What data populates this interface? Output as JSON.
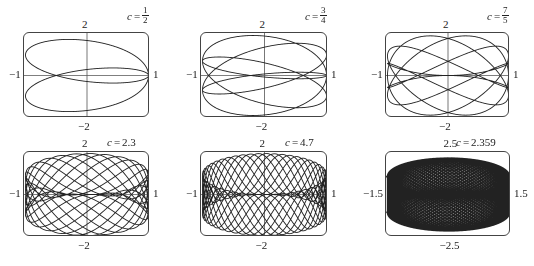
{
  "figure": {
    "line_color": "#222222",
    "axis_color": "#555555"
  },
  "chart_data": [
    {
      "type": "line",
      "title": "c = 1/2",
      "c_label": {
        "var": "c",
        "eq": "=",
        "num": "1",
        "den": "2",
        "is_fraction": true
      },
      "c": 0.5,
      "x_expr": "cos t",
      "y_expr": "sin t + sin(c t)",
      "t_range": [
        0,
        12.566
      ],
      "xlim": [
        -1,
        1
      ],
      "ylim": [
        -2,
        2
      ],
      "tick_labels": {
        "left": "−1",
        "right": "1",
        "top": "2",
        "bottom": "−2"
      },
      "box": {
        "left": 23,
        "top": 32,
        "width": 126,
        "height": 85
      },
      "axes": true
    },
    {
      "type": "line",
      "title": "c = 3/4",
      "c_label": {
        "var": "c",
        "eq": "=",
        "num": "3",
        "den": "4",
        "is_fraction": true
      },
      "c": 0.75,
      "x_expr": "cos t",
      "y_expr": "sin t + sin(c t)",
      "t_range": [
        0,
        25.133
      ],
      "xlim": [
        -1,
        1
      ],
      "ylim": [
        -2,
        2
      ],
      "tick_labels": {
        "left": "−1",
        "right": "1",
        "top": "2",
        "bottom": "−2"
      },
      "box": {
        "left": 200,
        "top": 32,
        "width": 127,
        "height": 85
      },
      "axes": true
    },
    {
      "type": "line",
      "title": "c = 7/5",
      "c_label": {
        "var": "c",
        "eq": "=",
        "num": "7",
        "den": "5",
        "is_fraction": true
      },
      "c": 1.4,
      "x_expr": "cos t",
      "y_expr": "sin t + sin(c t)",
      "t_range": [
        0,
        31.416
      ],
      "xlim": [
        -1,
        1
      ],
      "ylim": [
        -2,
        2
      ],
      "tick_labels": {
        "left": "−1",
        "right": "1",
        "top": "2",
        "bottom": "−2"
      },
      "box": {
        "left": 385,
        "top": 32,
        "width": 124,
        "height": 85
      },
      "axes": true
    },
    {
      "type": "line",
      "title": "c = 2.3",
      "c_label": {
        "var": "c",
        "eq": "=",
        "value": "2.3",
        "is_fraction": false
      },
      "c": 2.3,
      "x_expr": "cos t",
      "y_expr": "sin t + sin(c t)",
      "t_range": [
        0,
        62.832
      ],
      "xlim": [
        -1,
        1
      ],
      "ylim": [
        -2,
        2
      ],
      "tick_labels": {
        "left": "−1",
        "right": "1",
        "top": "2",
        "bottom": "−2"
      },
      "box": {
        "left": 23,
        "top": 151,
        "width": 126,
        "height": 85
      },
      "axes": true
    },
    {
      "type": "line",
      "title": "c = 4.7",
      "c_label": {
        "var": "c",
        "eq": "=",
        "value": "4.7",
        "is_fraction": false
      },
      "c": 4.7,
      "x_expr": "cos t",
      "y_expr": "sin t + sin(c t)",
      "t_range": [
        0,
        62.832
      ],
      "xlim": [
        -1,
        1
      ],
      "ylim": [
        -2,
        2
      ],
      "tick_labels": {
        "left": "−1",
        "right": "1",
        "top": "2",
        "bottom": "−2"
      },
      "box": {
        "left": 200,
        "top": 151,
        "width": 127,
        "height": 85
      },
      "axes": true
    },
    {
      "type": "line",
      "title": "c = 2.359",
      "c_label": {
        "var": "c",
        "eq": "=",
        "value": "2.359",
        "is_fraction": false
      },
      "c": 2.359,
      "x_expr": "cos t",
      "y_expr": "sin t + sin(c t)",
      "t_range": [
        0,
        1200
      ],
      "xlim": [
        -1.5,
        1.5
      ],
      "ylim": [
        -2.5,
        2.5
      ],
      "render_xlim": [
        -1.0,
        1.0
      ],
      "render_ylim": [
        -2.25,
        2.25
      ],
      "tick_labels": {
        "left": "−1.5",
        "right": "1.5",
        "top": "2.5",
        "bottom": "−2.5"
      },
      "box": {
        "left": 385,
        "top": 151,
        "width": 125,
        "height": 85
      },
      "axes": false
    }
  ]
}
